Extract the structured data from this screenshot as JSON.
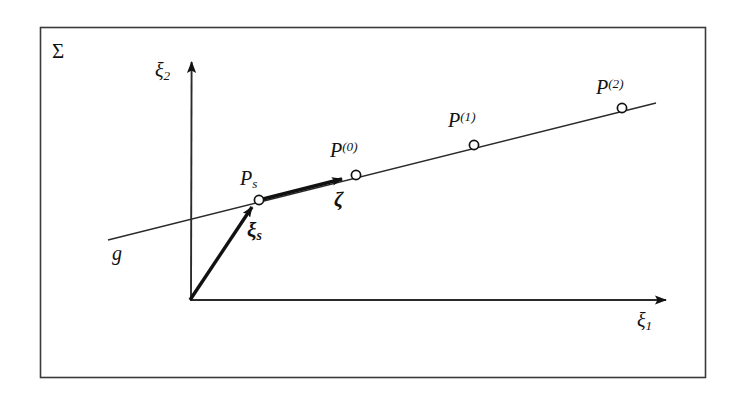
{
  "figure": {
    "domain_label": "Σ",
    "background_color": "#ffffff",
    "ink_color": "#121212",
    "border": {
      "x": 40,
      "y": 27,
      "width": 665,
      "height": 350
    }
  },
  "axes": {
    "origin": {
      "x": 190,
      "y": 300
    },
    "x_axis": {
      "label": "ξ",
      "subscript": "1",
      "from": {
        "x": 190,
        "y": 300
      },
      "to": {
        "x": 672,
        "y": 300
      },
      "arrow": true
    },
    "y_axis": {
      "label": "ξ",
      "subscript": "2",
      "from": {
        "x": 190,
        "y": 300
      },
      "to": {
        "x": 192,
        "y": 57
      },
      "arrow": true
    }
  },
  "line": {
    "name": "g",
    "label": "g",
    "from": {
      "x": 108,
      "y": 240
    },
    "to": {
      "x": 656,
      "y": 103
    }
  },
  "points": [
    {
      "id": "ps",
      "label": "P",
      "subscript": "s",
      "superscript": "",
      "x": 259,
      "y": 200,
      "marker": "open-circle"
    },
    {
      "id": "p0",
      "label": "P",
      "subscript": "",
      "superscript": "(0)",
      "x": 356,
      "y": 175,
      "marker": "open-circle"
    },
    {
      "id": "p1",
      "label": "P",
      "subscript": "",
      "superscript": "(1)",
      "x": 474,
      "y": 145,
      "marker": "open-circle"
    },
    {
      "id": "p2",
      "label": "P",
      "subscript": "",
      "superscript": "(2)",
      "x": 622,
      "y": 108,
      "marker": "open-circle"
    }
  ],
  "vectors": [
    {
      "id": "xi-s",
      "label": "ξ",
      "subscript": "s",
      "description": "position vector from origin to Ps",
      "from": {
        "x": 190,
        "y": 300
      },
      "to": {
        "x": 255,
        "y": 203
      },
      "bold": true
    },
    {
      "id": "zeta",
      "label": "ζ",
      "subscript": "",
      "description": "direction vector along line g from Ps toward P(0)",
      "from": {
        "x": 259,
        "y": 200
      },
      "to": {
        "x": 348,
        "y": 177
      },
      "bold": true
    }
  ]
}
